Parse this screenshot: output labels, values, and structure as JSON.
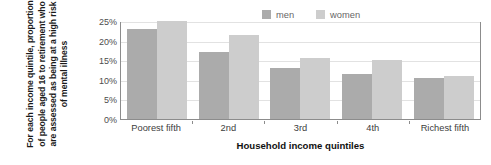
{
  "chart_data": {
    "type": "bar",
    "title": "",
    "xlabel": "Household income quintiles",
    "ylabel": "For each income quintile, proportion of people aged 16 to retirement who are assessed as being at a high risk of mental illness",
    "categories": [
      "Poorest fifth",
      "2nd",
      "3rd",
      "4th",
      "Richest fifth"
    ],
    "series": [
      {
        "name": "men",
        "values": [
          23,
          17,
          13,
          11.5,
          10.5
        ],
        "color": "#ababab"
      },
      {
        "name": "women",
        "values": [
          25,
          21.5,
          15.5,
          15,
          11
        ],
        "color": "#cdcdcd"
      }
    ],
    "ylim": [
      0,
      25
    ],
    "ytick_values": [
      0,
      5,
      10,
      15,
      20,
      25
    ],
    "ytick_labels": [
      "0%",
      "5%",
      "10%",
      "15%",
      "20%",
      "25%"
    ],
    "grid": true,
    "legend_position": "top-right",
    "value_unit": "%"
  },
  "legend": {
    "items": [
      {
        "label": "men",
        "color": "#ababab"
      },
      {
        "label": "women",
        "color": "#cdcdcd"
      }
    ]
  },
  "axes": {
    "x_title": "Household income quintiles",
    "y_title": "For each income quintile, proportion of people aged 16 to retirement who are assessed as being at a high risk of mental illness"
  }
}
